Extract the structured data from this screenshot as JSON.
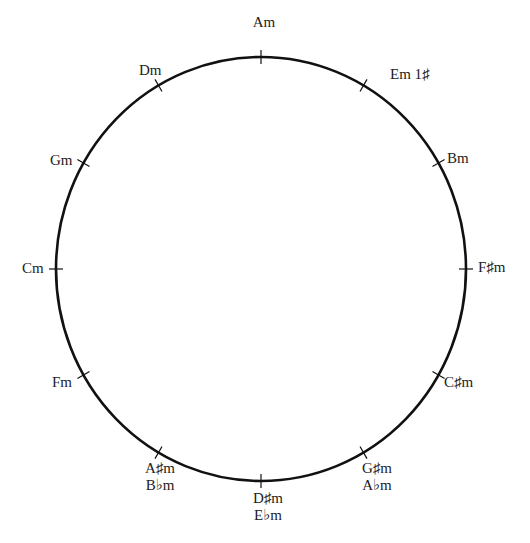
{
  "diagram": {
    "circle": {
      "cx": 261,
      "cy": 269,
      "rx": 205,
      "ry": 212,
      "stroke_color": "#111111",
      "tick_length": 14
    },
    "keys": [
      {
        "angle": 0,
        "lines": [
          "Am"
        ],
        "lx": 264,
        "ly": 14,
        "anchor": "center"
      },
      {
        "angle": 30,
        "lines": [
          "Em 1♯"
        ],
        "lx": 390,
        "ly": 66,
        "anchor": "left-tight"
      },
      {
        "angle": 60,
        "lines": [
          "Bm"
        ],
        "lx": 447,
        "ly": 150,
        "anchor": "left"
      },
      {
        "angle": 90,
        "lines": [
          "F♯m"
        ],
        "lx": 478,
        "ly": 259,
        "anchor": "left"
      },
      {
        "angle": 120,
        "lines": [
          "C♯m"
        ],
        "lx": 444,
        "ly": 374,
        "anchor": "left"
      },
      {
        "angle": 150,
        "lines": [
          "G♯m",
          "A♭m"
        ],
        "lx": 377,
        "ly": 460,
        "anchor": "center"
      },
      {
        "angle": 180,
        "lines": [
          "D♯m",
          "E♭m"
        ],
        "lx": 268,
        "ly": 490,
        "anchor": "center"
      },
      {
        "angle": 210,
        "lines": [
          "A♯m",
          "B♭m"
        ],
        "lx": 160,
        "ly": 460,
        "anchor": "center"
      },
      {
        "angle": 240,
        "lines": [
          "Fm"
        ],
        "lx": 52,
        "ly": 374,
        "anchor": "left"
      },
      {
        "angle": 270,
        "lines": [
          "Cm"
        ],
        "lx": 22,
        "ly": 260,
        "anchor": "left"
      },
      {
        "angle": 300,
        "lines": [
          "Gm"
        ],
        "lx": 50,
        "ly": 152,
        "anchor": "left"
      },
      {
        "angle": 330,
        "lines": [
          "Dm"
        ],
        "lx": 139,
        "ly": 62,
        "anchor": "left"
      }
    ]
  }
}
